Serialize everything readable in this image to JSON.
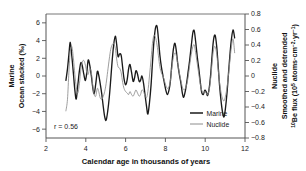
{
  "figure": {
    "background": "#ffffff",
    "plot_frame_color": "#555555"
  },
  "chart_data": {
    "type": "line",
    "title": "",
    "subtitle": "",
    "xlabel": "Calendar age in thousands of years",
    "ylabel_left_line1": "Marine",
    "ylabel_left_line2": "Ocean stacked (‰)",
    "ylabel_right_line1": "Nuclide",
    "ylabel_right_line2_a": "Smoothed and detrended",
    "ylabel_right_line2_b_prefix": "Be flux (10",
    "ylabel_right_sup_10": "10",
    "ylabel_right_sup_5": "5",
    "ylabel_right_units_mid": " atoms·cm",
    "ylabel_right_sup_m2": "−2",
    "ylabel_right_units_yr": "·yr",
    "ylabel_right_sup_m1": "−1",
    "ylabel_right_units_close": ")",
    "xlim": [
      2,
      12
    ],
    "ylim_left": [
      -7,
      7
    ],
    "ylim_right": [
      -0.8,
      0.8
    ],
    "xticks": [
      2,
      4,
      6,
      8,
      10,
      12
    ],
    "xtick_labels": [
      "2",
      "4",
      "6",
      "8",
      "10",
      "12"
    ],
    "yticks_left": [
      -6,
      -4,
      -2,
      0,
      2,
      4,
      6
    ],
    "ytick_labels_left": [
      "−6",
      "−4",
      "−2",
      "0",
      "2",
      "4",
      "6"
    ],
    "yticks_right": [
      -0.8,
      -0.6,
      -0.4,
      -0.2,
      0,
      0.2,
      0.4,
      0.6,
      0.8
    ],
    "ytick_labels_right": [
      "−0.8",
      "−0.6",
      "−0.4",
      "−0.2",
      "0",
      "0.2",
      "0.4",
      "0.6",
      "0.8"
    ],
    "grid": false,
    "legend_position": "lower-right-inside",
    "annotations": [
      {
        "name": "correlation",
        "text": "r = 0.56",
        "x": 2.35,
        "y": -5.9
      }
    ],
    "series": [
      {
        "name": "Marine",
        "color": "#1a1a1a",
        "axis": "left",
        "units": "‰",
        "x": [
          3.0,
          3.08,
          3.15,
          3.22,
          3.3,
          3.38,
          3.45,
          3.52,
          3.6,
          3.68,
          3.75,
          3.82,
          3.9,
          3.98,
          4.05,
          4.12,
          4.2,
          4.28,
          4.35,
          4.42,
          4.5,
          4.58,
          4.65,
          4.72,
          4.8,
          4.88,
          4.95,
          5.02,
          5.1,
          5.18,
          5.25,
          5.32,
          5.4,
          5.48,
          5.55,
          5.62,
          5.7,
          5.78,
          5.85,
          5.92,
          6.0,
          6.08,
          6.15,
          6.22,
          6.3,
          6.38,
          6.45,
          6.52,
          6.6,
          6.68,
          6.75,
          6.82,
          6.9,
          6.98,
          7.05,
          7.12,
          7.2,
          7.28,
          7.35,
          7.42,
          7.5,
          7.58,
          7.65,
          7.72,
          7.8,
          7.88,
          7.95,
          8.02,
          8.1,
          8.18,
          8.25,
          8.32,
          8.4,
          8.48,
          8.55,
          8.62,
          8.7,
          8.78,
          8.85,
          8.92,
          9.0,
          9.08,
          9.15,
          9.22,
          9.3,
          9.38,
          9.45,
          9.52,
          9.6,
          9.68,
          9.75,
          9.82,
          9.9,
          9.98,
          10.05,
          10.12,
          10.2,
          10.28,
          10.35,
          10.42,
          10.5,
          10.58,
          10.65,
          10.72,
          10.8,
          10.88,
          10.95,
          11.02,
          11.1,
          11.18,
          11.25,
          11.32,
          11.4,
          11.48
        ],
        "y": [
          -0.5,
          0.8,
          2.4,
          3.8,
          2.2,
          0.2,
          -1.6,
          -2.6,
          -1.0,
          0.6,
          1.5,
          1.2,
          0.2,
          -0.5,
          0.4,
          1.8,
          1.2,
          0.0,
          -1.3,
          -2.0,
          -0.9,
          0.5,
          0.1,
          -0.8,
          -2.0,
          -3.5,
          -4.6,
          -5.0,
          -4.0,
          -2.4,
          -0.5,
          1.6,
          3.5,
          4.5,
          3.6,
          2.2,
          2.5,
          2.3,
          1.0,
          -0.3,
          -1.0,
          -0.4,
          0.8,
          1.3,
          0.4,
          -0.6,
          -0.2,
          0.6,
          0.2,
          -0.6,
          -0.5,
          0.0,
          -0.8,
          -2.2,
          -3.4,
          -4.3,
          -3.0,
          -1.0,
          1.5,
          3.8,
          5.4,
          5.6,
          4.2,
          2.4,
          1.0,
          0.0,
          -0.8,
          -1.6,
          -2.1,
          -1.6,
          -0.6,
          1.2,
          3.0,
          3.7,
          2.8,
          1.4,
          0.2,
          -0.8,
          -1.9,
          -2.4,
          -1.7,
          -0.6,
          0.6,
          1.8,
          3.4,
          4.9,
          5.1,
          3.9,
          2.2,
          0.8,
          -0.6,
          -1.8,
          -2.1,
          -1.6,
          -1.8,
          -2.2,
          -1.4,
          0.3,
          2.4,
          4.1,
          4.6,
          3.3,
          1.2,
          -1.0,
          -2.9,
          -4.2,
          -4.6,
          -3.6,
          -1.8,
          0.6,
          2.6,
          4.2,
          5.2,
          4.3
        ]
      },
      {
        "name": "Nuclide",
        "color": "#8c8c8c",
        "axis": "right",
        "units": "10^5 atoms·cm−2·yr−1",
        "x": [
          3.0,
          3.08,
          3.15,
          3.22,
          3.3,
          3.38,
          3.45,
          3.52,
          3.6,
          3.68,
          3.75,
          3.82,
          3.9,
          3.98,
          4.05,
          4.12,
          4.2,
          4.28,
          4.35,
          4.42,
          4.5,
          4.58,
          4.65,
          4.72,
          4.8,
          4.88,
          4.95,
          5.02,
          5.1,
          5.18,
          5.25,
          5.32,
          5.4,
          5.48,
          5.55,
          5.62,
          5.7,
          5.78,
          5.85,
          5.92,
          6.0,
          6.08,
          6.15,
          6.22,
          6.3,
          6.38,
          6.45,
          6.52,
          6.6,
          6.68,
          6.75,
          6.82,
          6.9,
          6.98,
          7.05,
          7.12,
          7.2,
          7.28,
          7.35,
          7.42,
          7.5,
          7.58,
          7.65,
          7.72,
          7.8,
          7.88,
          7.95,
          8.02,
          8.1,
          8.18,
          8.25,
          8.32,
          8.4,
          8.48,
          8.55,
          8.62,
          8.7,
          8.78,
          8.85,
          8.92,
          9.0,
          9.08,
          9.15,
          9.22,
          9.3,
          9.38,
          9.45,
          9.52,
          9.6,
          9.68,
          9.75,
          9.82,
          9.9,
          9.98,
          10.05,
          10.12,
          10.2,
          10.28,
          10.35,
          10.42,
          10.5,
          10.58,
          10.65,
          10.72,
          10.8,
          10.88,
          10.95,
          11.02,
          11.1,
          11.18,
          11.25,
          11.32,
          11.4,
          11.48
        ],
        "y": [
          -0.45,
          -0.3,
          0.05,
          0.32,
          0.38,
          0.22,
          0.02,
          -0.14,
          -0.22,
          -0.1,
          0.08,
          0.18,
          0.2,
          0.14,
          0.05,
          0.02,
          0.1,
          0.04,
          -0.12,
          -0.24,
          -0.26,
          -0.16,
          -0.2,
          -0.28,
          -0.3,
          -0.26,
          -0.2,
          -0.1,
          0.06,
          0.22,
          0.34,
          0.4,
          0.42,
          0.36,
          0.22,
          0.12,
          0.1,
          0.04,
          -0.08,
          -0.16,
          -0.2,
          -0.22,
          -0.24,
          -0.2,
          -0.24,
          -0.26,
          -0.22,
          -0.18,
          -0.22,
          -0.26,
          -0.24,
          -0.18,
          -0.2,
          -0.26,
          -0.28,
          -0.2,
          0.0,
          0.22,
          0.42,
          0.52,
          0.5,
          0.4,
          0.26,
          0.12,
          0.04,
          0.0,
          -0.06,
          -0.12,
          -0.16,
          -0.14,
          -0.06,
          0.1,
          0.24,
          0.3,
          0.26,
          0.16,
          0.04,
          -0.06,
          -0.14,
          -0.18,
          -0.16,
          -0.1,
          0.0,
          0.14,
          0.28,
          0.38,
          0.4,
          0.3,
          0.16,
          0.02,
          -0.1,
          -0.18,
          -0.22,
          -0.2,
          -0.22,
          -0.24,
          -0.18,
          -0.02,
          0.18,
          0.34,
          0.38,
          0.28,
          0.1,
          -0.08,
          -0.22,
          -0.3,
          -0.32,
          -0.26,
          -0.14,
          0.04,
          0.22,
          0.38,
          0.48,
          0.3
        ]
      }
    ],
    "legend": [
      {
        "label": "Marine",
        "color": "#1a1a1a"
      },
      {
        "label": "Nuclide",
        "color": "#8c8c8c"
      }
    ]
  }
}
